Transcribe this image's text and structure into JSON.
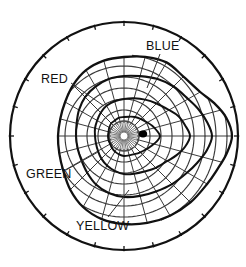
{
  "figure": {
    "name": "color-visual-field-perimetry-chart",
    "type": "polar-isopter-plot",
    "background_color": "#ffffff",
    "ink_color": "#111111",
    "grid_color": "#3a3a3a"
  },
  "labels": {
    "blue": "BLUE",
    "red": "RED",
    "green": "GREEN",
    "yellow": "YELLOW"
  },
  "chart_data": {
    "type": "line",
    "title": "",
    "subtitle": "",
    "xlabel": "",
    "ylabel": "",
    "projection": "polar",
    "grid": true,
    "legend_position": "inline-leader-labels",
    "center": {
      "x": 124,
      "y": 136
    },
    "outer_circle": {
      "name": "perimeter-boundary",
      "radius_px": 114,
      "tick_count": 24,
      "tick_length_px": 4
    },
    "blind_spot": {
      "name": "blind-spot-marker",
      "x": 143,
      "y": 134,
      "rx": 4.2,
      "ry": 3.4,
      "fill": "#000000"
    },
    "fixation_hub": {
      "name": "fixation-point-hub",
      "x": 124,
      "y": 136,
      "inner_radius_px": 4,
      "outer_radius_px": 15,
      "spoke_count": 40
    },
    "polar_grid": {
      "spoke_count": 24,
      "ring_radii_px": [
        15,
        26,
        37,
        48,
        59,
        70,
        81,
        92,
        103
      ],
      "ring_count": 9
    },
    "axis_ranges": {
      "radial_degrees": [
        0,
        90
      ],
      "angular_degrees": [
        0,
        360
      ]
    },
    "series": [
      {
        "name": "BLUE",
        "label": "BLUE",
        "order": "outermost",
        "color": "#111111",
        "stroke_width": 2.3,
        "leader": {
          "x1": 160,
          "y1": 54,
          "x2": 147,
          "y2": 88
        },
        "points_deg_r": [
          [
            90,
            79
          ],
          [
            75,
            82
          ],
          [
            60,
            85
          ],
          [
            45,
            84
          ],
          [
            30,
            88
          ],
          [
            20,
            96
          ],
          [
            10,
            104
          ],
          [
            0,
            108
          ],
          [
            350,
            104
          ],
          [
            340,
            99
          ],
          [
            330,
            96
          ],
          [
            315,
            94
          ],
          [
            300,
            92
          ],
          [
            285,
            90
          ],
          [
            270,
            88
          ],
          [
            255,
            86
          ],
          [
            240,
            82
          ],
          [
            225,
            76
          ],
          [
            210,
            70
          ],
          [
            195,
            67
          ],
          [
            180,
            66
          ],
          [
            165,
            66
          ],
          [
            150,
            68
          ],
          [
            135,
            72
          ],
          [
            120,
            76
          ],
          [
            105,
            78
          ]
        ]
      },
      {
        "name": "YELLOW",
        "label": "YELLOW",
        "order": "second",
        "color": "#111111",
        "stroke_width": 2.1,
        "leader": {
          "x1": 108,
          "y1": 217,
          "x2": 129,
          "y2": 190
        },
        "points_deg_r": [
          [
            90,
            60
          ],
          [
            75,
            62
          ],
          [
            60,
            66
          ],
          [
            45,
            70
          ],
          [
            30,
            74
          ],
          [
            20,
            79
          ],
          [
            10,
            84
          ],
          [
            0,
            88
          ],
          [
            350,
            84
          ],
          [
            340,
            78
          ],
          [
            330,
            73
          ],
          [
            315,
            68
          ],
          [
            300,
            64
          ],
          [
            285,
            62
          ],
          [
            270,
            61
          ],
          [
            255,
            59
          ],
          [
            240,
            56
          ],
          [
            225,
            52
          ],
          [
            210,
            49
          ],
          [
            195,
            48
          ],
          [
            180,
            48
          ],
          [
            165,
            49
          ],
          [
            150,
            52
          ],
          [
            135,
            55
          ],
          [
            120,
            57
          ],
          [
            105,
            59
          ]
        ]
      },
      {
        "name": "RED",
        "label": "RED",
        "order": "third",
        "color": "#111111",
        "stroke_width": 2.0,
        "leader": {
          "x1": 71,
          "y1": 83,
          "x2": 104,
          "y2": 106
        },
        "points_deg_r": [
          [
            90,
            37
          ],
          [
            75,
            39
          ],
          [
            60,
            42
          ],
          [
            45,
            46
          ],
          [
            30,
            52
          ],
          [
            20,
            58
          ],
          [
            10,
            62
          ],
          [
            0,
            66
          ],
          [
            350,
            62
          ],
          [
            340,
            56
          ],
          [
            330,
            50
          ],
          [
            315,
            45
          ],
          [
            300,
            41
          ],
          [
            285,
            39
          ],
          [
            270,
            38
          ],
          [
            255,
            36
          ],
          [
            240,
            34
          ],
          [
            225,
            32
          ],
          [
            210,
            30
          ],
          [
            195,
            29
          ],
          [
            180,
            29
          ],
          [
            165,
            30
          ],
          [
            150,
            31
          ],
          [
            135,
            33
          ],
          [
            120,
            35
          ],
          [
            105,
            36
          ]
        ]
      },
      {
        "name": "GREEN",
        "label": "GREEN",
        "order": "innermost",
        "color": "#111111",
        "stroke_width": 1.9,
        "leader": {
          "x1": 66,
          "y1": 170,
          "x2": 98,
          "y2": 152
        },
        "points_deg_r": [
          [
            90,
            19
          ],
          [
            75,
            20
          ],
          [
            60,
            22
          ],
          [
            45,
            24
          ],
          [
            30,
            27
          ],
          [
            20,
            30
          ],
          [
            10,
            33
          ],
          [
            0,
            36
          ],
          [
            350,
            33
          ],
          [
            340,
            29
          ],
          [
            330,
            26
          ],
          [
            315,
            23
          ],
          [
            300,
            21
          ],
          [
            285,
            20
          ],
          [
            270,
            20
          ],
          [
            255,
            19
          ],
          [
            240,
            18
          ],
          [
            225,
            17
          ],
          [
            210,
            16
          ],
          [
            195,
            16
          ],
          [
            180,
            16
          ],
          [
            165,
            16
          ],
          [
            150,
            17
          ],
          [
            135,
            18
          ],
          [
            120,
            18
          ],
          [
            105,
            19
          ]
        ]
      }
    ]
  }
}
